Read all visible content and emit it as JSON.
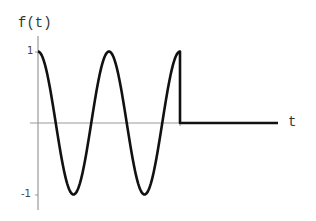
{
  "chart_data": {
    "type": "line",
    "title": "",
    "xlabel": "t",
    "ylabel": "f(t)",
    "yticks": [
      "1",
      "-1"
    ],
    "ylim": [
      -1,
      1
    ],
    "series": [
      {
        "name": "f(t)",
        "x": [
          0,
          0.25,
          0.5,
          0.75,
          1.0,
          1.25,
          1.5,
          1.75,
          2.0,
          2.0,
          2.5,
          3.0
        ],
        "values": [
          1,
          0,
          -1,
          0,
          1,
          0,
          -1,
          0,
          1,
          0,
          0,
          0
        ]
      }
    ]
  },
  "labels": {
    "y_axis": "f(t)",
    "x_axis": "t",
    "tick_pos": "1",
    "tick_neg": "-1"
  }
}
